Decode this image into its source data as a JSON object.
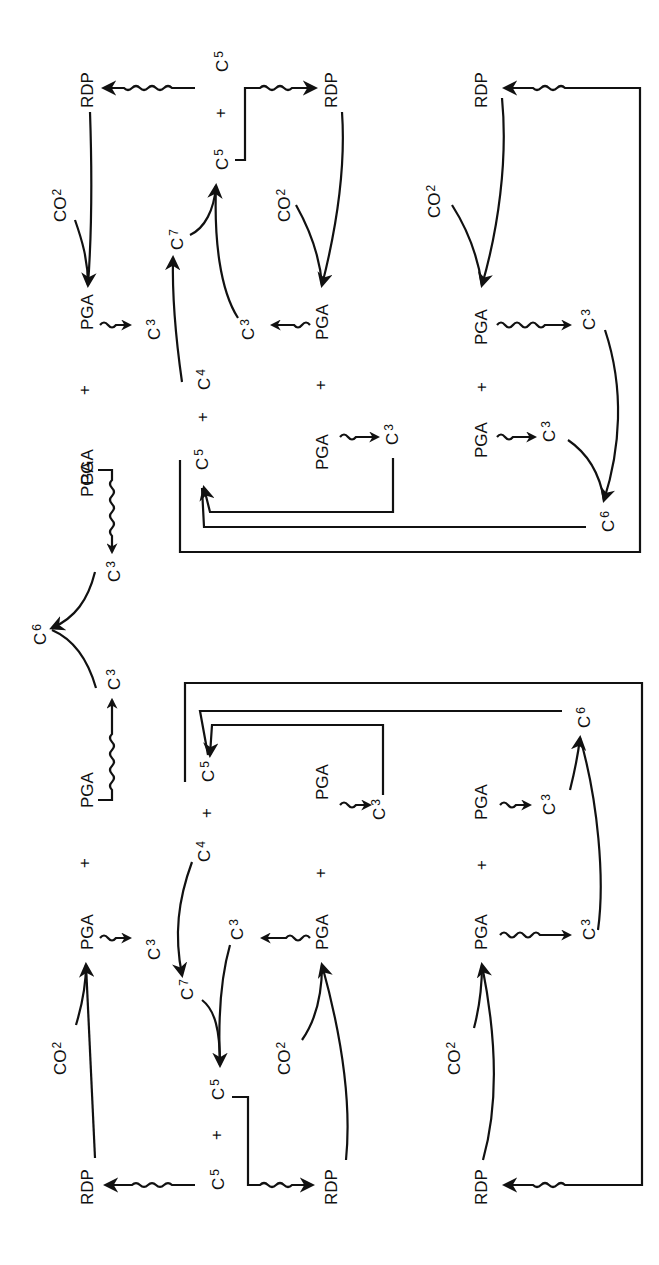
{
  "diagram": {
    "orientation": "rotated 90 degrees counter-clockwise",
    "labels": {
      "rdp": "RDP",
      "co2": "CO",
      "co2_sub": "2",
      "pga": "PGA",
      "plus": "+",
      "c": "C",
      "c3_sub": "3",
      "c4_sub": "4",
      "c5_sub": "5",
      "c6_sub": "6",
      "c7_sub": "7"
    },
    "sections": [
      {
        "name": "top-half",
        "rows": [
          "RDP + CO2 -> PGA ~> C3; C3 + C4 -> C7; C7 + C3 -> C5 + C5; C5 ~> RDP",
          "RDP + CO2 -> PGA ~> C3 (joins C7 pathway)",
          "RDP + CO2 -> PGA ~> C3; PGA ~> C3; C3 + C3 -> C6; C6 -> C5 feedback; C5 ~> RDP"
        ]
      },
      {
        "name": "center",
        "rows": [
          "PGA ~> C3; PGA ~> C3; C3 + C3 -> C6"
        ]
      },
      {
        "name": "bottom-half",
        "rows": [
          "RDP + CO2 -> PGA ~> C3; C4 + C3 -> C7; C7 + C3 -> C5 + C5; C5 ~> RDP",
          "RDP + CO2 -> PGA ~> C3",
          "RDP + CO2 -> PGA ~> C3; PGA ~> C3; C3 + C3 -> C6; C6 -> C5 feedback; ~> RDP"
        ]
      }
    ]
  }
}
